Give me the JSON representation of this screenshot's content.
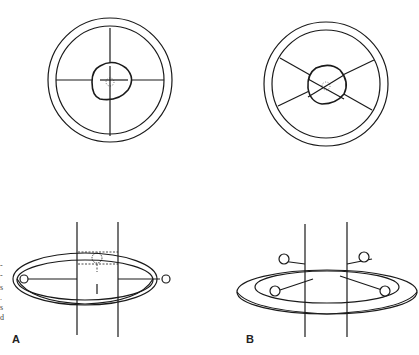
{
  "figure": {
    "panels": [
      {
        "id": "A",
        "label": "A",
        "top_view": "circular ring with four perpendicular spokes (cross) and irregular central hub",
        "side_view": "ring clamp around vertical post with bolts, dashed hidden bolt behind post"
      },
      {
        "id": "B",
        "label": "B",
        "top_view": "circular ring with four diagonal spokes (X) and irregular central hub",
        "side_view": "ring clamp around vertical post with four bolts"
      }
    ],
    "margin_text_fragments": [
      "-",
      "-",
      "s",
      ".",
      "s",
      "d"
    ]
  }
}
